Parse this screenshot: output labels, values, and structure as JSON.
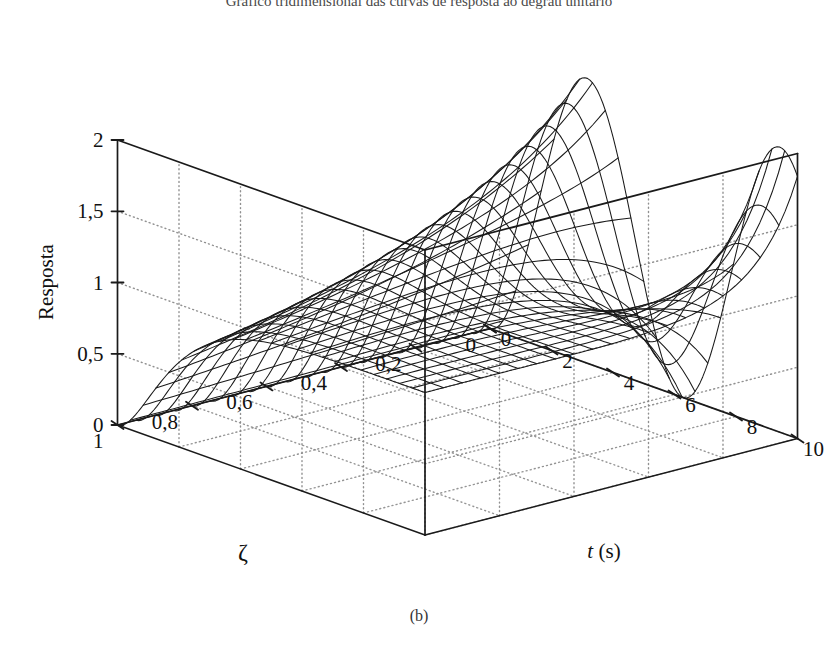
{
  "figure": {
    "title": "Gráfico tridimensional das curvas de resposta ao degrau unitário",
    "caption": "(b)",
    "background_color": "#ffffff",
    "line_color": "#1a1a1a",
    "grid_color": "#8a8a8a"
  },
  "axes": {
    "z": {
      "title": "Resposta",
      "ticks": [
        "0",
        "0,5",
        "1",
        "1,5",
        "2"
      ],
      "values": [
        0,
        0.5,
        1,
        1.5,
        2
      ],
      "range": [
        0,
        2
      ]
    },
    "zeta": {
      "title": "ζ",
      "ticks": [
        "1",
        "0,8",
        "0,6",
        "0,4",
        "0,2",
        "0"
      ],
      "values": [
        1,
        0.8,
        0.6,
        0.4,
        0.2,
        0
      ],
      "range": [
        0,
        1
      ],
      "reversed": true
    },
    "t": {
      "title_var": "t",
      "title_unit": "(s)",
      "ticks": [
        "0",
        "2",
        "4",
        "6",
        "8",
        "10"
      ],
      "values": [
        0,
        2,
        4,
        6,
        8,
        10
      ],
      "range": [
        0,
        10
      ]
    }
  },
  "chart_data": {
    "type": "surface",
    "title": "Gráfico tridimensional das curvas de resposta ao degrau unitário",
    "xlabel": "t (s)",
    "ylabel": "ζ",
    "zlabel": "Resposta",
    "xlim": [
      0,
      10
    ],
    "ylim": [
      0,
      1
    ],
    "zlim": [
      0,
      2
    ],
    "grid": true,
    "legend": null,
    "model": {
      "formula": "y(t) = 1 - exp(-z*wn*t)*(cos(wd*t) + (z/sqrt(1-z^2))*sin(wd*t)), wd = wn*sqrt(1-z^2)",
      "wn": 1.0
    },
    "mesh": {
      "zeta_lines": 21,
      "t_lines": 25,
      "t_samples": 121,
      "zeta_samples": 61
    },
    "sample_points": [
      {
        "zeta": 0.0,
        "t": 0,
        "y": 0.0
      },
      {
        "zeta": 0.0,
        "t": 2,
        "y": 1.42
      },
      {
        "zeta": 0.0,
        "t": 3.14,
        "y": 2.0
      },
      {
        "zeta": 0.0,
        "t": 6.28,
        "y": 0.0
      },
      {
        "zeta": 0.0,
        "t": 9.42,
        "y": 2.0
      },
      {
        "zeta": 0.0,
        "t": 10,
        "y": 1.84
      },
      {
        "zeta": 0.2,
        "t": 3.2,
        "y": 1.53
      },
      {
        "zeta": 0.4,
        "t": 3.4,
        "y": 1.25
      },
      {
        "zeta": 0.6,
        "t": 3.9,
        "y": 1.09
      },
      {
        "zeta": 0.8,
        "t": 5.0,
        "y": 1.02
      },
      {
        "zeta": 1.0,
        "t": 5.0,
        "y": 0.96
      },
      {
        "zeta": 1.0,
        "t": 10,
        "y": 1.0
      }
    ]
  },
  "projection": {
    "origin_px": {
      "x": 117.5,
      "y": 425.0
    },
    "t_axis_vector_px": {
      "x": 307.5,
      "y": 110.0
    },
    "zeta_axis_vector_px": {
      "x": 372.5,
      "y": -96.5
    },
    "z_axis_height_px": 285.0
  }
}
